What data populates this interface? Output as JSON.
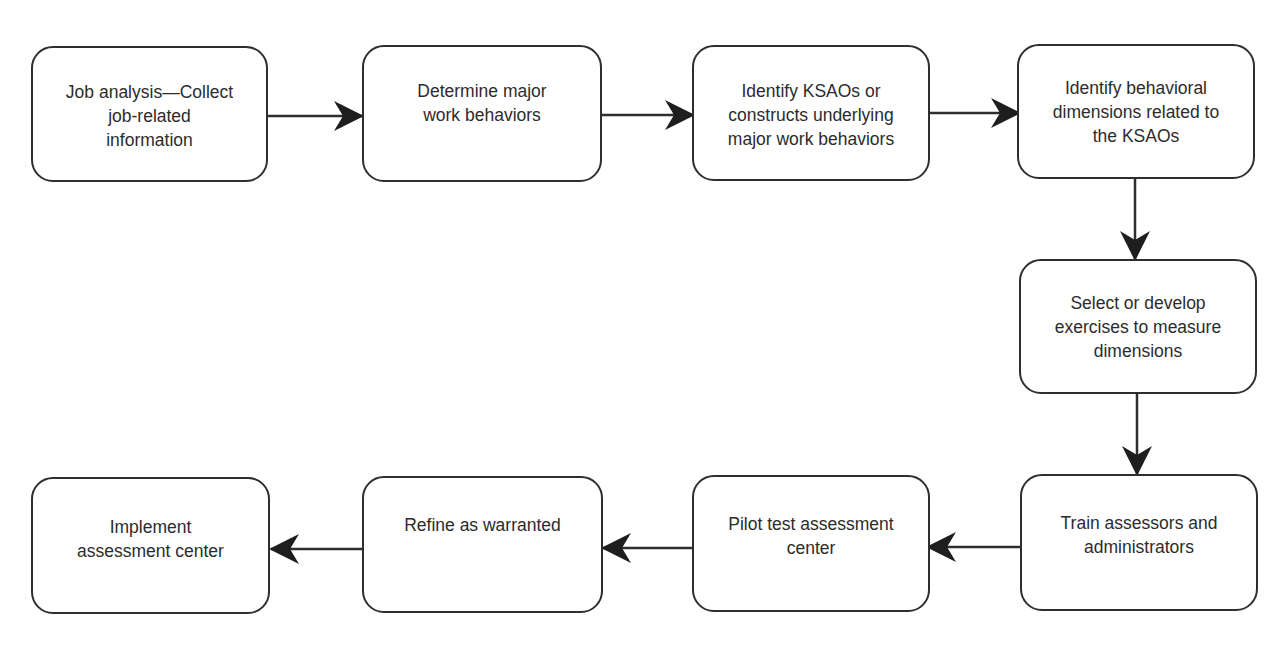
{
  "diagram": {
    "type": "flowchart",
    "colors": {
      "stroke": "#2e2e2e",
      "text": "#2c2c2c",
      "background": "#ffffff"
    },
    "nodes": [
      {
        "id": "n1",
        "label": "Job analysis—Collect\njob-related\ninformation"
      },
      {
        "id": "n2",
        "label": "Determine major\nwork behaviors"
      },
      {
        "id": "n3",
        "label": "Identify KSAOs or\nconstructs underlying\nmajor work behaviors"
      },
      {
        "id": "n4",
        "label": "Identify behavioral\ndimensions related to\nthe KSAOs"
      },
      {
        "id": "n5",
        "label": "Select or develop\nexercises to measure\ndimensions"
      },
      {
        "id": "n6",
        "label": "Train assessors and\nadministrators"
      },
      {
        "id": "n7",
        "label": "Pilot test assessment\ncenter"
      },
      {
        "id": "n8",
        "label": "Refine as warranted"
      },
      {
        "id": "n9",
        "label": "Implement\nassessment center"
      }
    ],
    "edges": [
      {
        "from": "n1",
        "to": "n2",
        "direction": "right"
      },
      {
        "from": "n2",
        "to": "n3",
        "direction": "right"
      },
      {
        "from": "n3",
        "to": "n4",
        "direction": "right"
      },
      {
        "from": "n4",
        "to": "n5",
        "direction": "down"
      },
      {
        "from": "n5",
        "to": "n6",
        "direction": "down"
      },
      {
        "from": "n6",
        "to": "n7",
        "direction": "left"
      },
      {
        "from": "n7",
        "to": "n8",
        "direction": "left"
      },
      {
        "from": "n8",
        "to": "n9",
        "direction": "left"
      }
    ]
  }
}
